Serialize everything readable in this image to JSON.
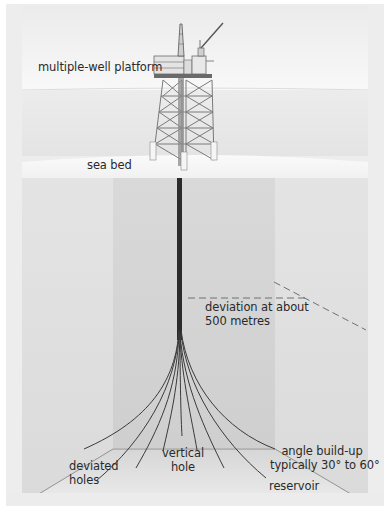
{
  "diagram": {
    "labels": {
      "platform": "multiple-well platform",
      "sea_bed": "sea bed",
      "deviation_line1": "deviation at about",
      "deviation_line2": "500 metres",
      "deviated_line1": "deviated",
      "deviated_line2": "holes",
      "vertical_line1": "vertical",
      "vertical_line2": "hole",
      "angle_line1": "angle build-up",
      "angle_line2": "typically 30° to 60°",
      "reservoir": "reservoir"
    },
    "colors": {
      "frame_bg": "#ededed",
      "sky": "#f2f2f2",
      "sea": "#e9e9e9",
      "sea_bed_surface": "#f7f7f7",
      "rock_outer": "#e2e2e2",
      "rock_inner": "#d2d2d2",
      "reservoir_floor": "#dcdcdc",
      "wellbore": "#2b2b2b",
      "label_text": "#2a2a2a"
    }
  }
}
